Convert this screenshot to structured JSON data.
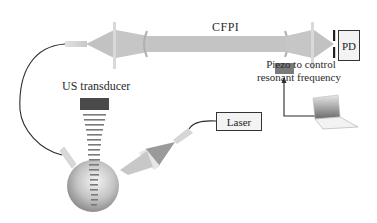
{
  "diagram": {
    "title_labels": {
      "cfpi": "CFPI",
      "piezo_line1": "Piezo to control",
      "piezo_line2": "resonant frequency",
      "us_transducer": "US transducer"
    },
    "boxes": {
      "pd": "PD",
      "laser": "Laser"
    },
    "components": [
      {
        "id": "cfpi-beam",
        "label": "CFPI"
      },
      {
        "id": "photodetector",
        "label": "PD"
      },
      {
        "id": "piezo",
        "label": "Piezo to control resonant frequency"
      },
      {
        "id": "laptop",
        "label": ""
      },
      {
        "id": "laser",
        "label": "Laser"
      },
      {
        "id": "us-transducer",
        "label": "US transducer"
      },
      {
        "id": "sample-sphere",
        "label": ""
      }
    ],
    "colors": {
      "beam": "#bdbdbd",
      "lens": "#d6d6d6",
      "piezo": "#7a7a7a",
      "transducer": "#4a4a4a",
      "line": "#2b2b2b"
    }
  }
}
